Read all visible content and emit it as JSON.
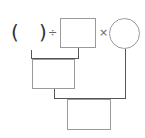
{
  "diagram": {
    "open_paren": "(",
    "close_paren": ")",
    "divide_sign": "÷",
    "multiply_sign": "×",
    "boxes": [
      "",
      "",
      ""
    ],
    "circle_value": ""
  }
}
